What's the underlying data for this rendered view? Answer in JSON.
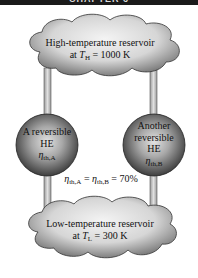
{
  "header": {
    "text": "CHAPTER 6"
  },
  "high_reservoir": {
    "line1": "High-temperature reservoir",
    "line2_prefix": "at ",
    "symbol": "T",
    "subscript": "H",
    "line2_suffix": " = 1000 K"
  },
  "low_reservoir": {
    "line1": "Low-temperature reservoir",
    "line2_prefix": "at ",
    "symbol": "T",
    "subscript": "L",
    "line2_suffix": " = 300 K"
  },
  "engine_a": {
    "line1": "A reversible",
    "line2": "HE",
    "eta": "η",
    "eta_sub": "th,A"
  },
  "engine_b": {
    "line1": "Another",
    "line2": "reversible",
    "line3": "HE",
    "eta": "η",
    "eta_sub": "th,B"
  },
  "equation": {
    "eta1": "η",
    "sub1": "th,A",
    "eq1": " = ",
    "eta2": "η",
    "sub2": "th,B",
    "eq2": " = 70%"
  },
  "colors": {
    "header": "#1a1a1a",
    "pipe": "#c8c8c8",
    "pipe_edge": "#555555",
    "sphere_light": "#d8d8d8",
    "sphere_dark": "#4a4a4a",
    "cloud_light": "#f2f2f2",
    "cloud_dark": "#7a7a7a"
  }
}
